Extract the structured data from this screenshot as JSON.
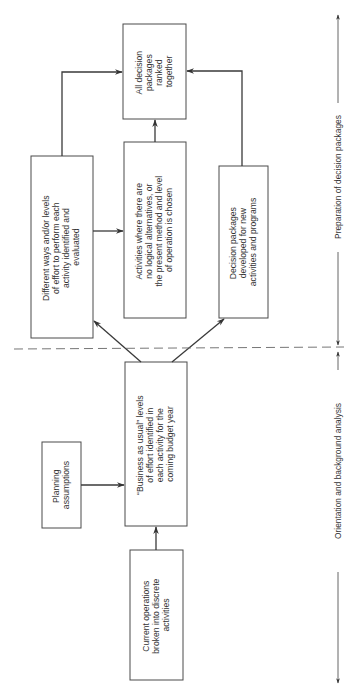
{
  "diagram": {
    "orientation": "rotated-90-ccw",
    "nodes": [
      {
        "id": "ranked",
        "lines": [
          "All decision",
          "packages",
          "ranked",
          "together"
        ]
      },
      {
        "id": "alternatives",
        "lines": [
          "Different ways and/or levels",
          "of effort to perform each",
          "activity identified and",
          "evaluated"
        ]
      },
      {
        "id": "no-alternatives",
        "lines": [
          "Activities where there are",
          "no logical alternatives, or",
          "the present method and level",
          "of operation is chosen"
        ]
      },
      {
        "id": "new-programs",
        "lines": [
          "Decision packages",
          "developed for new",
          "activities and programs"
        ]
      },
      {
        "id": "business-as-usual",
        "lines": [
          "“Business as usual” levels",
          "of effort identified in",
          "each activity for the",
          "coming budget year"
        ]
      },
      {
        "id": "planning",
        "lines": [
          "Planning",
          "assumptions"
        ]
      },
      {
        "id": "current-ops",
        "lines": [
          "Current operations",
          "broken into discrete",
          "activities"
        ]
      }
    ],
    "edges": [
      {
        "from": "current-ops",
        "to": "business-as-usual"
      },
      {
        "from": "planning",
        "to": "business-as-usual"
      },
      {
        "from": "business-as-usual",
        "to": "alternatives"
      },
      {
        "from": "business-as-usual",
        "to": "new-programs"
      },
      {
        "from": "alternatives",
        "to": "no-alternatives"
      },
      {
        "from": "alternatives",
        "to": "ranked"
      },
      {
        "from": "no-alternatives",
        "to": "ranked"
      },
      {
        "from": "new-programs",
        "to": "ranked"
      }
    ],
    "phases": [
      {
        "label": "Preparation of decision packages"
      },
      {
        "label": "Orientation and background analysis"
      }
    ]
  }
}
